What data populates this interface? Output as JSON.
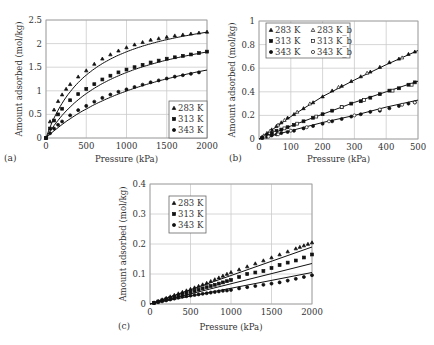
{
  "figure": {
    "panels": [
      {
        "id": "a",
        "label": "(a)"
      },
      {
        "id": "b",
        "label": "(b)"
      },
      {
        "id": "c",
        "label": "(c)"
      }
    ]
  },
  "chart_data": [
    {
      "panel": "(a)",
      "type": "scatter",
      "title": "",
      "xlabel": "Pressure (kPa)",
      "ylabel": "Amount adsorbed (mol/kg)",
      "xlim": [
        0,
        2000
      ],
      "ylim": [
        0,
        2.5
      ],
      "xticks": [
        0,
        500,
        1000,
        1500,
        2000
      ],
      "yticks": [
        0,
        0.5,
        1,
        1.5,
        2,
        2.5
      ],
      "ytick_labels": [
        "0",
        "0.5",
        "1",
        "1.5",
        "2",
        "2.5"
      ],
      "grid": true,
      "legend_position": "lower right",
      "series": [
        {
          "name": "283 K",
          "marker": "triangle-filled",
          "x": [
            0,
            50,
            100,
            150,
            200,
            250,
            300,
            400,
            500,
            600,
            700,
            800,
            900,
            1000,
            1100,
            1200,
            1300,
            1400,
            1500,
            1600,
            1700,
            1800,
            1900,
            2000
          ],
          "y": [
            0,
            0.35,
            0.6,
            0.78,
            0.92,
            1.04,
            1.14,
            1.3,
            1.43,
            1.57,
            1.68,
            1.77,
            1.85,
            1.92,
            1.98,
            2.03,
            2.08,
            2.11,
            2.14,
            2.17,
            2.19,
            2.21,
            2.23,
            2.25
          ],
          "fit": {
            "type": "langmuir",
            "qmax": 2.9,
            "b": 0.0017
          }
        },
        {
          "name": "313 K",
          "marker": "square-filled",
          "x": [
            0,
            50,
            100,
            150,
            200,
            300,
            400,
            500,
            600,
            700,
            800,
            900,
            1000,
            1100,
            1200,
            1300,
            1400,
            1500,
            1600,
            1700,
            1800,
            1900,
            2000
          ],
          "y": [
            0,
            0.2,
            0.37,
            0.5,
            0.62,
            0.8,
            0.93,
            1.04,
            1.14,
            1.24,
            1.32,
            1.39,
            1.45,
            1.5,
            1.55,
            1.6,
            1.64,
            1.68,
            1.71,
            1.74,
            1.77,
            1.8,
            1.83
          ],
          "fit": {
            "type": "langmuir",
            "qmax": 2.65,
            "b": 0.0011
          }
        },
        {
          "name": "343 K",
          "marker": "circle-filled",
          "x": [
            0,
            50,
            100,
            150,
            200,
            300,
            400,
            500,
            600,
            700,
            800,
            900,
            1000,
            1100,
            1200,
            1300,
            1400,
            1500,
            1600,
            1700,
            1800,
            1900
          ],
          "y": [
            0,
            0.1,
            0.2,
            0.28,
            0.35,
            0.48,
            0.59,
            0.68,
            0.77,
            0.85,
            0.92,
            0.98,
            1.03,
            1.08,
            1.13,
            1.18,
            1.22,
            1.26,
            1.3,
            1.33,
            1.36,
            1.39
          ],
          "fit": {
            "type": "langmuir",
            "qmax": 2.6,
            "b": 0.00062
          }
        }
      ]
    },
    {
      "panel": "(b)",
      "type": "scatter",
      "title": "",
      "xlabel": "Pressure (kPa)",
      "ylabel": "Amount adsorbed (mol/kg)",
      "xlim": [
        0,
        500
      ],
      "ylim": [
        0,
        1
      ],
      "xticks": [
        0,
        100,
        200,
        300,
        400,
        500
      ],
      "yticks": [
        0,
        0.2,
        0.4,
        0.6,
        0.8,
        1
      ],
      "ytick_labels": [
        "0",
        "0.2",
        "0.4",
        "0.6",
        "0.8",
        "1"
      ],
      "grid": true,
      "legend_position": "upper left",
      "series": [
        {
          "name": "283 K",
          "marker": "triangle-filled",
          "x": [
            10,
            25,
            40,
            55,
            70,
            90,
            110,
            140,
            170,
            200,
            230,
            260,
            290,
            320,
            350,
            380,
            410,
            440,
            470,
            490
          ],
          "y": [
            0.02,
            0.05,
            0.08,
            0.11,
            0.14,
            0.18,
            0.21,
            0.26,
            0.31,
            0.36,
            0.41,
            0.45,
            0.49,
            0.53,
            0.57,
            0.61,
            0.65,
            0.68,
            0.72,
            0.74
          ],
          "fit": {
            "type": "curve",
            "pts": [
              [
                0,
                0
              ],
              [
                100,
                0.19
              ],
              [
                200,
                0.36
              ],
              [
                300,
                0.5
              ],
              [
                400,
                0.63
              ],
              [
                500,
                0.75
              ]
            ]
          }
        },
        {
          "name": "283 K_b",
          "marker": "triangle-open",
          "x": [
            15,
            35,
            60,
            80,
            120,
            160,
            250,
            340,
            450
          ],
          "y": [
            0.03,
            0.07,
            0.12,
            0.16,
            0.23,
            0.3,
            0.44,
            0.56,
            0.69
          ]
        },
        {
          "name": "313 K",
          "marker": "square-filled",
          "x": [
            10,
            25,
            40,
            55,
            70,
            90,
            110,
            140,
            170,
            200,
            230,
            260,
            290,
            320,
            350,
            380,
            410,
            440,
            470,
            490
          ],
          "y": [
            0.01,
            0.03,
            0.05,
            0.07,
            0.08,
            0.1,
            0.12,
            0.15,
            0.18,
            0.21,
            0.24,
            0.27,
            0.3,
            0.32,
            0.35,
            0.38,
            0.41,
            0.43,
            0.46,
            0.48
          ],
          "fit": {
            "type": "curve",
            "pts": [
              [
                0,
                0
              ],
              [
                100,
                0.11
              ],
              [
                200,
                0.21
              ],
              [
                300,
                0.31
              ],
              [
                400,
                0.4
              ],
              [
                500,
                0.49
              ]
            ]
          }
        },
        {
          "name": "313 K_b",
          "marker": "square-open",
          "x": [
            20,
            50,
            80,
            120,
            180,
            260,
            330,
            420,
            480
          ],
          "y": [
            0.02,
            0.05,
            0.09,
            0.13,
            0.19,
            0.27,
            0.33,
            0.41,
            0.46
          ]
        },
        {
          "name": "343 K",
          "marker": "circle-filled",
          "x": [
            10,
            25,
            40,
            55,
            70,
            90,
            110,
            140,
            170,
            200,
            230,
            260,
            290,
            320,
            350,
            380,
            410,
            440,
            470,
            490
          ],
          "y": [
            0.01,
            0.02,
            0.03,
            0.04,
            0.05,
            0.06,
            0.07,
            0.09,
            0.11,
            0.13,
            0.15,
            0.17,
            0.19,
            0.21,
            0.23,
            0.24,
            0.26,
            0.28,
            0.3,
            0.31
          ],
          "fit": {
            "type": "curve",
            "pts": [
              [
                0,
                0
              ],
              [
                100,
                0.07
              ],
              [
                200,
                0.14
              ],
              [
                300,
                0.2
              ],
              [
                400,
                0.27
              ],
              [
                500,
                0.33
              ]
            ]
          }
        },
        {
          "name": "343 K_b",
          "marker": "circle-open",
          "x": [
            30,
            60,
            100,
            150,
            220,
            300,
            380,
            450,
            490
          ],
          "y": [
            0.02,
            0.04,
            0.07,
            0.1,
            0.15,
            0.2,
            0.25,
            0.29,
            0.31
          ]
        }
      ]
    },
    {
      "panel": "(c)",
      "type": "scatter",
      "title": "",
      "xlabel": "Pressure (kPa)",
      "ylabel": "Amount adsorbed (mol/kg)",
      "xlim": [
        0,
        2000
      ],
      "ylim": [
        0,
        0.4
      ],
      "xticks": [
        0,
        500,
        1000,
        1500,
        2000
      ],
      "yticks": [
        0,
        0.1,
        0.2,
        0.3,
        0.4
      ],
      "ytick_labels": [
        "0",
        "0.1",
        "0.2",
        "0.3",
        "0.4"
      ],
      "grid": true,
      "legend_position": "upper left",
      "series": [
        {
          "name": "283 K",
          "marker": "triangle-filled",
          "x": [
            50,
            100,
            150,
            200,
            250,
            300,
            350,
            400,
            450,
            500,
            550,
            600,
            650,
            700,
            750,
            800,
            850,
            900,
            950,
            1000,
            1100,
            1200,
            1300,
            1400,
            1500,
            1600,
            1700,
            1800,
            1850,
            1900,
            1950,
            2000
          ],
          "y": [
            0.005,
            0.01,
            0.015,
            0.02,
            0.025,
            0.03,
            0.035,
            0.04,
            0.045,
            0.05,
            0.055,
            0.06,
            0.065,
            0.07,
            0.076,
            0.082,
            0.088,
            0.094,
            0.1,
            0.106,
            0.115,
            0.125,
            0.135,
            0.145,
            0.155,
            0.165,
            0.175,
            0.185,
            0.19,
            0.195,
            0.2,
            0.205
          ],
          "fit": {
            "type": "line",
            "pts": [
              [
                0,
                0
              ],
              [
                2000,
                0.19
              ]
            ]
          }
        },
        {
          "name": "313 K",
          "marker": "square-filled",
          "x": [
            50,
            100,
            150,
            200,
            250,
            300,
            350,
            400,
            450,
            500,
            550,
            600,
            650,
            700,
            750,
            800,
            850,
            900,
            950,
            1000,
            1100,
            1200,
            1300,
            1400,
            1500,
            1600,
            1700,
            1800,
            1900,
            2000
          ],
          "y": [
            0.004,
            0.008,
            0.012,
            0.016,
            0.02,
            0.024,
            0.028,
            0.032,
            0.036,
            0.04,
            0.044,
            0.048,
            0.052,
            0.056,
            0.06,
            0.064,
            0.068,
            0.072,
            0.076,
            0.08,
            0.09,
            0.1,
            0.105,
            0.11,
            0.12,
            0.13,
            0.138,
            0.145,
            0.155,
            0.165
          ],
          "fit": {
            "type": "line",
            "pts": [
              [
                0,
                0
              ],
              [
                2000,
                0.135
              ]
            ]
          }
        },
        {
          "name": "343 K",
          "marker": "circle-filled",
          "x": [
            50,
            100,
            150,
            200,
            250,
            300,
            350,
            400,
            450,
            500,
            550,
            600,
            650,
            700,
            750,
            800,
            850,
            900,
            950,
            1000,
            1100,
            1200,
            1300,
            1400,
            1500,
            1600,
            1700,
            1800,
            1900,
            2000
          ],
          "y": [
            0.003,
            0.006,
            0.009,
            0.012,
            0.015,
            0.018,
            0.021,
            0.024,
            0.026,
            0.028,
            0.03,
            0.032,
            0.034,
            0.036,
            0.038,
            0.04,
            0.042,
            0.044,
            0.045,
            0.047,
            0.052,
            0.056,
            0.06,
            0.064,
            0.068,
            0.072,
            0.078,
            0.084,
            0.09,
            0.096
          ],
          "fit": {
            "type": "line",
            "pts": [
              [
                0,
                0
              ],
              [
                2000,
                0.105
              ]
            ]
          }
        }
      ]
    }
  ],
  "colors": {
    "axis": "#999999",
    "grid": "#cccccc",
    "marker": "#111111",
    "text": "#333333",
    "fit_line": "#111111"
  }
}
